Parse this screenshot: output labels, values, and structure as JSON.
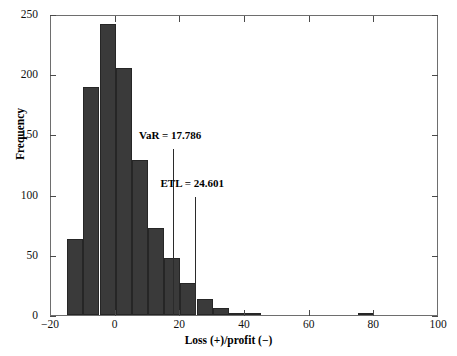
{
  "chart_data": {
    "type": "bar",
    "title": "",
    "subtitle": "",
    "xlabel": "Loss (+)/profit (−)",
    "ylabel": "Frequency",
    "xlim": [
      -20,
      100
    ],
    "ylim": [
      0,
      250
    ],
    "xticks": [
      -20,
      0,
      20,
      40,
      60,
      80,
      100
    ],
    "xtick_labels": [
      "−20",
      "0",
      "20",
      "40",
      "60",
      "80",
      "100"
    ],
    "yticks": [
      0,
      50,
      100,
      150,
      200,
      250
    ],
    "ytick_labels": [
      "0",
      "50",
      "100",
      "150",
      "200",
      "250"
    ],
    "grid": false,
    "legend": null,
    "bin_width": 5,
    "bar_color": "#3a3a3a",
    "bar_edge_color": "#262626",
    "bins": [
      {
        "x0": -15,
        "x1": -10,
        "value": 63
      },
      {
        "x0": -10,
        "x1": -5,
        "value": 189
      },
      {
        "x0": -5,
        "x1": 0,
        "value": 242
      },
      {
        "x0": 0,
        "x1": 5,
        "value": 205
      },
      {
        "x0": 5,
        "x1": 10,
        "value": 129
      },
      {
        "x0": 10,
        "x1": 15,
        "value": 72
      },
      {
        "x0": 15,
        "x1": 20,
        "value": 47
      },
      {
        "x0": 20,
        "x1": 25,
        "value": 27
      },
      {
        "x0": 25,
        "x1": 30,
        "value": 13
      },
      {
        "x0": 30,
        "x1": 35,
        "value": 6
      },
      {
        "x0": 35,
        "x1": 40,
        "value": 2
      },
      {
        "x0": 40,
        "x1": 45,
        "value": 1
      },
      {
        "x0": 75,
        "x1": 80,
        "value": 2
      }
    ],
    "annotations": [
      {
        "name": "var",
        "label": "VaR = 17.786",
        "value": 17.786,
        "label_x": 17.786,
        "label_y": 148,
        "line_from_y": 138,
        "line_to_y": 0,
        "color": "#2b2b2b"
      },
      {
        "name": "etl",
        "label": "ETL = 24.601",
        "value": 24.601,
        "label_x": 24.601,
        "label_y": 108,
        "line_from_y": 98,
        "line_to_y": 0,
        "color": "#2b2b2b"
      }
    ]
  }
}
